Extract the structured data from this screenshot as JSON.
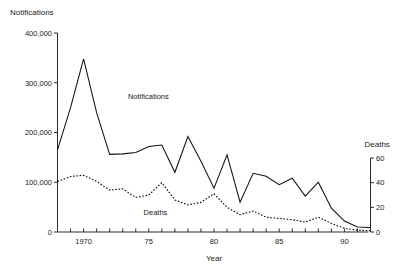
{
  "chart_data": {
    "type": "line",
    "title": "",
    "xlabel": "Year",
    "ylabel": "Notifications",
    "y2label": "Deaths",
    "grid": false,
    "legend": "inline-annotations",
    "xlim": [
      1968,
      1992
    ],
    "ylim": [
      0,
      400000
    ],
    "y2lim": [
      0,
      60
    ],
    "x": [
      1968,
      1969,
      1970,
      1971,
      1972,
      1973,
      1974,
      1975,
      1976,
      1977,
      1978,
      1979,
      1980,
      1981,
      1982,
      1983,
      1984,
      1985,
      1986,
      1987,
      1988,
      1989,
      1990,
      1991,
      1992
    ],
    "xtick_values": [
      1970,
      1975,
      1980,
      1985,
      1990
    ],
    "xtick_labels": [
      "1970",
      "75",
      "80",
      "85",
      "90"
    ],
    "xticks_minor_every": 1,
    "ytick_values": [
      0,
      100000,
      200000,
      300000,
      400000
    ],
    "ytick_labels": [
      "0",
      "100,000",
      "200,000",
      "300,000",
      "400,000"
    ],
    "y2tick_values": [
      0,
      20,
      40,
      60
    ],
    "y2tick_labels": [
      "0",
      "20",
      "40",
      "60"
    ],
    "series": [
      {
        "name": "Notifications",
        "axis": "left",
        "style": "solid",
        "color": "#111111",
        "label_x": 1973.4,
        "label_y": 268000,
        "values": [
          165000,
          250000,
          348000,
          240000,
          156000,
          157000,
          160000,
          172000,
          175000,
          120000,
          192000,
          142000,
          88000,
          155000,
          60000,
          118000,
          112000,
          95000,
          108000,
          72000,
          100000,
          48000,
          22000,
          10000,
          9000
        ]
      },
      {
        "name": "Deaths",
        "axis": "right",
        "style": "dotted",
        "color": "#111111",
        "label_x": 1974.6,
        "label_y": 13.5,
        "values": [
          41,
          45,
          46,
          41,
          34,
          35,
          28,
          30,
          40,
          26,
          22,
          24,
          31,
          20,
          14,
          17,
          12,
          11,
          10,
          8,
          12,
          7,
          3,
          1.5,
          1
        ]
      }
    ],
    "annotations": [
      {
        "name": "notifications-series-label",
        "text": "Notifications"
      },
      {
        "name": "deaths-series-label",
        "text": "Deaths"
      }
    ]
  },
  "labels": {
    "left_axis_title": "Notifications",
    "right_axis_title": "Deaths",
    "x_axis_title": "Year"
  }
}
